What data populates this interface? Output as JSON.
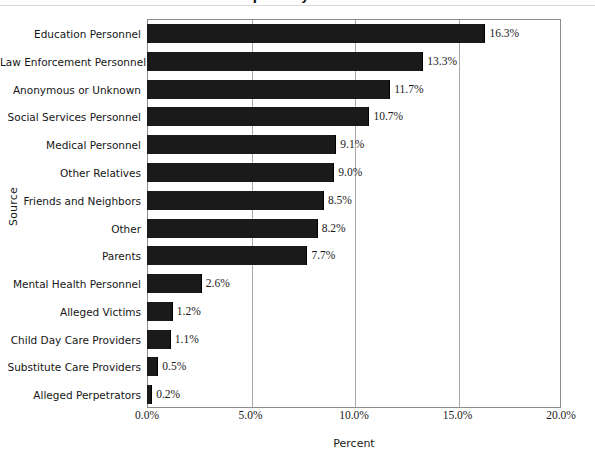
{
  "chart_data": {
    "type": "bar",
    "orientation": "horizontal",
    "title": "Reports by Source",
    "xlabel": "Percent",
    "ylabel": "Source",
    "xlim": [
      0,
      20
    ],
    "xtick_labels": [
      "0.0%",
      "5.0%",
      "10.0%",
      "15.0%",
      "20.0%"
    ],
    "xtick_values": [
      0,
      5,
      10,
      15,
      20
    ],
    "grid": "vertical",
    "legend": "none",
    "bar_color": "#1a1a1a",
    "categories": [
      "Education Personnel",
      "Law Enforcement Personnel",
      "Anonymous or Unknown",
      "Social Services Personnel",
      "Medical Personnel",
      "Other Relatives",
      "Friends and Neighbors",
      "Other",
      "Parents",
      "Mental Health Personnel",
      "Alleged Victims",
      "Child Day Care Providers",
      "Substitute Care Providers",
      "Alleged Perpetrators"
    ],
    "values": [
      16.3,
      13.3,
      11.7,
      10.7,
      9.1,
      9.0,
      8.5,
      8.2,
      7.7,
      2.6,
      1.2,
      1.1,
      0.5,
      0.2
    ],
    "value_labels": [
      "16.3%",
      "13.3%",
      "11.7%",
      "10.7%",
      "9.1%",
      "9.0%",
      "8.5%",
      "8.2%",
      "7.7%",
      "2.6%",
      "1.2%",
      "1.1%",
      "0.5%",
      "0.2%"
    ]
  }
}
